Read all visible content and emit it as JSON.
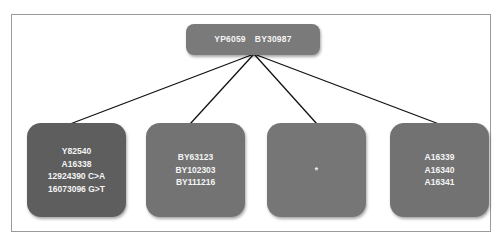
{
  "diagram": {
    "type": "tree",
    "root": {
      "labels": [
        "YP6059",
        "BY30987"
      ]
    },
    "children": [
      {
        "lines": [
          "Y82540",
          "A16338",
          "12924390 C>A",
          "16073096 G>T"
        ]
      },
      {
        "lines": [
          "BY63123",
          "BY102303",
          "BY111216"
        ]
      },
      {
        "lines": [
          "*"
        ]
      },
      {
        "lines": [
          "A16339",
          "A16340",
          "A16341"
        ]
      }
    ],
    "colors": {
      "root_fill": "#7a7a7a",
      "child_fills": [
        "#5e5e5e",
        "#737373",
        "#767676",
        "#727272"
      ],
      "text": "#f4f4f4",
      "connector": "#111111",
      "frame": "#9a9a9a"
    }
  }
}
